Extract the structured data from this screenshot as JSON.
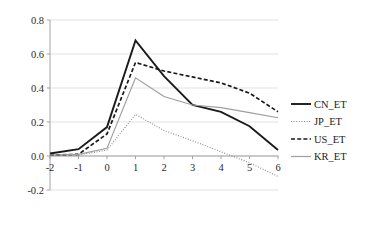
{
  "chart_data": {
    "type": "line",
    "title": "",
    "subtitle": "",
    "xlabel": "",
    "ylabel": "",
    "x": [
      -2,
      -1,
      0,
      1,
      2,
      3,
      4,
      5,
      6
    ],
    "xtick_labels": [
      "-2",
      "-1",
      "0",
      "1",
      "2",
      "3",
      "4",
      "5",
      "6"
    ],
    "ytick_labels": [
      "0.8",
      "0.6",
      "0.4",
      "0.2",
      "0.0",
      "-0.2"
    ],
    "yticks": [
      0.8,
      0.6,
      0.4,
      0.2,
      0.0,
      -0.2
    ],
    "xlim": [
      -2,
      6
    ],
    "ylim": [
      -0.2,
      0.8
    ],
    "grid": "horizontal",
    "legend_position": "right",
    "series": [
      {
        "name": "CN_ET",
        "values": [
          0.015,
          0.04,
          0.17,
          0.68,
          0.47,
          0.3,
          0.26,
          0.175,
          0.035
        ],
        "color": "#1a1a1a",
        "style": "solid",
        "width": 1.9,
        "dash": ""
      },
      {
        "name": "JP_ET",
        "values": [
          0.005,
          0.005,
          0.035,
          0.245,
          0.15,
          0.09,
          0.025,
          -0.04,
          -0.12
        ],
        "color": "#8a8a8a",
        "style": "dotted",
        "width": 1.1,
        "dash": "1,1.6"
      },
      {
        "name": "US_ET",
        "values": [
          0.005,
          0.01,
          0.13,
          0.55,
          0.5,
          0.465,
          0.43,
          0.37,
          0.26
        ],
        "color": "#1a1a1a",
        "style": "dashed",
        "width": 1.7,
        "dash": "4,2.2"
      },
      {
        "name": "KR_ET",
        "values": [
          0.005,
          0.01,
          0.045,
          0.46,
          0.35,
          0.3,
          0.285,
          0.255,
          0.225
        ],
        "color": "#9e9e9e",
        "style": "solid",
        "width": 1.2,
        "dash": ""
      }
    ]
  },
  "legend": {
    "items": [
      {
        "label": "CN_ET"
      },
      {
        "label": "JP_ET"
      },
      {
        "label": "US_ET"
      },
      {
        "label": "KR_ET"
      }
    ]
  },
  "axes": {
    "y_axis_name": "value-axis",
    "x_axis_name": "period-axis"
  }
}
